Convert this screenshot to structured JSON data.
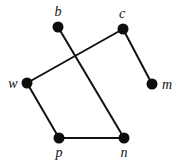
{
  "figure": {
    "background_color": "#ffffff",
    "width": 180,
    "height": 163
  },
  "style": {
    "node_color": "#0d0d0d",
    "node_radius": 5.5,
    "edge_color": "#111111",
    "edge_width": 2,
    "label_color": "#111111",
    "label_size": 14
  },
  "chart_data": {
    "type": "diagram",
    "graph_type": "undirected",
    "title": "",
    "node_count": 6,
    "edge_count": 5,
    "nodes": [
      {
        "id": "b",
        "label": "b",
        "x": 58,
        "y": 27,
        "label_x": 58,
        "label_y": 16,
        "label_pos": "above"
      },
      {
        "id": "c",
        "label": "c",
        "x": 123,
        "y": 29,
        "label_x": 122,
        "label_y": 18,
        "label_pos": "above"
      },
      {
        "id": "w",
        "label": "w",
        "x": 27,
        "y": 83,
        "label_x": 13,
        "label_y": 88,
        "label_pos": "left"
      },
      {
        "id": "m",
        "label": "m",
        "x": 152,
        "y": 84,
        "label_x": 167,
        "label_y": 89,
        "label_pos": "right"
      },
      {
        "id": "p",
        "label": "p",
        "x": 59,
        "y": 138,
        "label_x": 59,
        "label_y": 157,
        "label_pos": "below"
      },
      {
        "id": "n",
        "label": "n",
        "x": 124,
        "y": 138,
        "label_x": 124,
        "label_y": 157,
        "label_pos": "below"
      }
    ],
    "edges": [
      {
        "source": "b",
        "target": "n",
        "x1": 58,
        "y1": 27,
        "x2": 124,
        "y2": 138
      },
      {
        "source": "c",
        "target": "w",
        "x1": 123,
        "y1": 29,
        "x2": 27,
        "y2": 83
      },
      {
        "source": "c",
        "target": "m",
        "x1": 123,
        "y1": 29,
        "x2": 152,
        "y2": 84
      },
      {
        "source": "w",
        "target": "p",
        "x1": 27,
        "y1": 83,
        "x2": 59,
        "y2": 138
      },
      {
        "source": "p",
        "target": "n",
        "x1": 59,
        "y1": 138,
        "x2": 124,
        "y2": 138
      }
    ],
    "crossings": [
      {
        "between": [
          "b-n",
          "c-w"
        ],
        "x": 73,
        "y": 57
      }
    ]
  }
}
